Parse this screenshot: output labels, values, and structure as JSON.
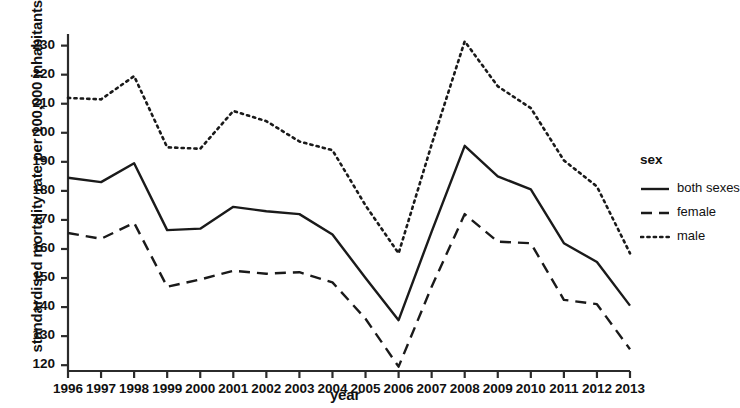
{
  "chart_data": {
    "type": "line",
    "title": "",
    "xlabel": "year",
    "ylabel": "standardised mortality rate per 100,000 inhabitants",
    "legend_title": "sex",
    "legend_position": "right",
    "grid": false,
    "xlim": [
      1996,
      2013
    ],
    "ylim": [
      118,
      234
    ],
    "x": [
      1996,
      1997,
      1998,
      1999,
      2000,
      2001,
      2002,
      2003,
      2004,
      2005,
      2006,
      2007,
      2008,
      2009,
      2010,
      2011,
      2012,
      2013
    ],
    "xticks": [
      "1996",
      "1997",
      "1998",
      "1999",
      "2000",
      "2001",
      "2002",
      "2003",
      "2004",
      "2005",
      "2006",
      "2007",
      "2008",
      "2009",
      "2010",
      "2011",
      "2012",
      "2013"
    ],
    "yticks": [
      "120",
      "130",
      "140",
      "150",
      "160",
      "170",
      "180",
      "190",
      "200",
      "210",
      "220",
      "230"
    ],
    "series": [
      {
        "name": "both sexes",
        "style": "solid",
        "color": "#1a1a1a",
        "values": [
          184.5,
          183.0,
          189.5,
          166.5,
          167.0,
          174.5,
          173.0,
          172.0,
          165.0,
          150.0,
          135.5,
          166.0,
          195.5,
          185.0,
          180.5,
          162.0,
          155.5,
          140.5
        ]
      },
      {
        "name": "female",
        "style": "dashed",
        "color": "#1a1a1a",
        "values": [
          165.5,
          163.5,
          169.0,
          147.0,
          149.5,
          152.5,
          151.5,
          152.0,
          148.5,
          136.0,
          119.5,
          147.0,
          172.0,
          162.5,
          162.0,
          142.5,
          141.0,
          125.5
        ]
      },
      {
        "name": "male",
        "style": "dotted",
        "color": "#1a1a1a",
        "values": [
          212.0,
          211.5,
          219.5,
          195.0,
          194.5,
          207.5,
          204.0,
          197.0,
          194.0,
          175.0,
          158.5,
          196.0,
          231.5,
          216.0,
          208.5,
          190.5,
          181.5,
          158.5
        ]
      }
    ]
  }
}
